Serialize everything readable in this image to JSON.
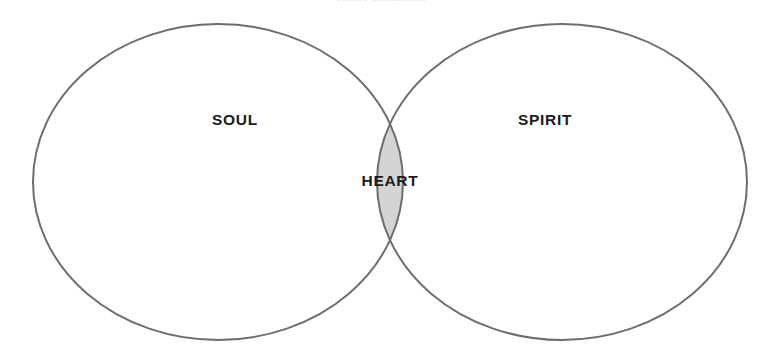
{
  "document": {
    "title": "VENN DIAGRAM",
    "background_color": "#ffffff"
  },
  "diagram": {
    "type": "venn",
    "set_count": 2,
    "stroke_color": "#6d6d6d",
    "stroke_width": 2,
    "set_fill_color": "#ffffff",
    "intersection_fill_color": "#d4d4d4",
    "label_color": "#1b1b1b",
    "sets": [
      {
        "id": "soul",
        "label": "SOUL",
        "fill": "#ffffff",
        "center_x": 218,
        "center_y": 182,
        "radius_x": 185,
        "radius_y": 158,
        "label_x": 235,
        "label_y": 121
      },
      {
        "id": "spirit",
        "label": "SPIRIT",
        "fill": "#ffffff",
        "center_x": 562,
        "center_y": 182,
        "radius_x": 185,
        "radius_y": 158,
        "label_x": 545,
        "label_y": 121
      }
    ],
    "intersection": {
      "id": "heart",
      "label": "HEART",
      "fill": "#d4d4d4",
      "members": [
        "soul",
        "spirit"
      ],
      "label_x": 390,
      "label_y": 182,
      "crossing_top_x": 390,
      "crossing_top_y": 83,
      "crossing_bottom_x": 390,
      "crossing_bottom_y": 288
    }
  }
}
